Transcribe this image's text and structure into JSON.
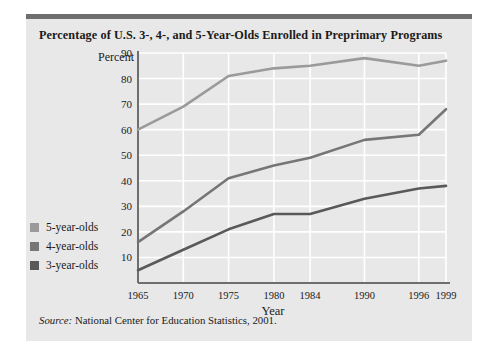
{
  "chart_data": {
    "type": "line",
    "title": "Percentage of U.S. 3-, 4-, and 5-Year-Olds Enrolled in Preprimary Programs",
    "xlabel": "Year",
    "ylabel": "Percent",
    "x": [
      1965,
      1970,
      1975,
      1980,
      1984,
      1990,
      1996,
      1999
    ],
    "xtick_labels": [
      "1965",
      "1970",
      "1975",
      "1980",
      "1984",
      "1990",
      "1996",
      "1999"
    ],
    "ytick_labels": [
      "10",
      "20",
      "30",
      "40",
      "50",
      "60",
      "70",
      "80",
      "90"
    ],
    "yticks": [
      10,
      20,
      30,
      40,
      50,
      60,
      70,
      80,
      90
    ],
    "ylim": [
      0,
      90
    ],
    "xlim": [
      1965,
      1999
    ],
    "grid": true,
    "legend_position": "left-outside",
    "series": [
      {
        "name": "5-year-olds",
        "color": "#9a9a9a",
        "values": [
          60,
          69,
          81,
          84,
          85,
          88,
          85,
          87
        ]
      },
      {
        "name": "4-year-olds",
        "color": "#767676",
        "values": [
          16,
          28,
          41,
          46,
          49,
          56,
          58,
          68
        ]
      },
      {
        "name": "3-year-olds",
        "color": "#595959",
        "values": [
          5,
          13,
          21,
          27,
          27,
          33,
          37,
          38
        ]
      }
    ],
    "source": "National Center for Education Statistics, 2001."
  },
  "chart": {
    "title": "Percentage of U.S. 3-, 4-, and 5-Year-Olds Enrolled in Preprimary Programs",
    "y_axis_title": "Percent",
    "x_axis_title": "Year",
    "source_prefix": "Source:",
    "source_text": "National Center for Education Statistics, 2001.",
    "legend": [
      {
        "label": "5-year-olds",
        "color": "#9a9a9a"
      },
      {
        "label": "4-year-olds",
        "color": "#767676"
      },
      {
        "label": "3-year-olds",
        "color": "#595959"
      }
    ],
    "colors": {
      "card_background": "#e8e8e8",
      "top_bar": "#6e6e6e",
      "axis": "#6e6e6e",
      "gridline": "#ffffff",
      "text": "#1a1a1a"
    }
  }
}
